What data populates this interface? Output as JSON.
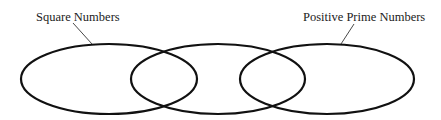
{
  "diagram": {
    "type": "venn",
    "title": "",
    "sets": [
      {
        "id": "left",
        "label": "Square Numbers",
        "label_pos": {
          "x": 36,
          "y": 21
        },
        "leader": {
          "x1": 73,
          "y1": 23,
          "x2": 92,
          "y2": 44
        },
        "ellipse": {
          "cx": 109,
          "cy": 79,
          "rx": 88,
          "ry": 35
        }
      },
      {
        "id": "middle",
        "label": "",
        "ellipse": {
          "cx": 218,
          "cy": 79,
          "rx": 87,
          "ry": 35
        }
      },
      {
        "id": "right",
        "label": "Positive Prime Numbers",
        "label_pos": {
          "x": 303,
          "y": 21
        },
        "leader": {
          "x1": 354,
          "y1": 24,
          "x2": 341,
          "y2": 44
        },
        "ellipse": {
          "cx": 327,
          "cy": 79,
          "rx": 87,
          "ry": 35
        }
      }
    ],
    "colors": {
      "stroke": "#111111",
      "text": "#222222",
      "background": "#ffffff"
    }
  }
}
